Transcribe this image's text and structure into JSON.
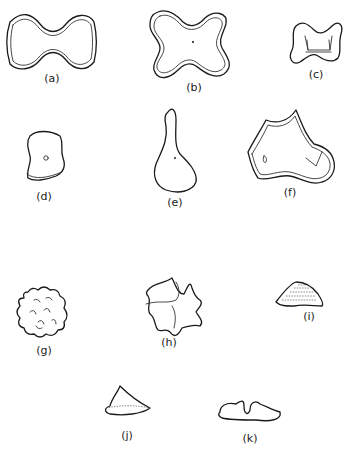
{
  "figure": {
    "panels": [
      {
        "id": "a",
        "label": "(a)",
        "shape": "double-walled dumbbell / bowtie outline"
      },
      {
        "id": "b",
        "label": "(b)",
        "shape": "four-lobed cross outline with central dot"
      },
      {
        "id": "c",
        "label": "(c)",
        "shape": "small bowtie with inner H-shaped structure"
      },
      {
        "id": "d",
        "label": "(d)",
        "shape": "cylinder with central pore"
      },
      {
        "id": "e",
        "label": "(e)",
        "shape": "pear / flask shape with dot"
      },
      {
        "id": "f",
        "label": "(f)",
        "shape": "irregular pointed plate"
      },
      {
        "id": "g",
        "label": "(g)",
        "shape": "rounded wavy-edged form with surface markings"
      },
      {
        "id": "h",
        "label": "(h)",
        "shape": "irregular spiky form"
      },
      {
        "id": "i",
        "label": "(i)",
        "shape": "stippled mound"
      },
      {
        "id": "j",
        "label": "(j)",
        "shape": "conical cap"
      },
      {
        "id": "k",
        "label": "(k)",
        "shape": "flat base with central notch"
      }
    ]
  }
}
